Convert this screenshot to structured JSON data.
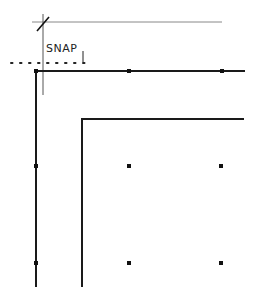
{
  "diagram": {
    "snap_label": "SNAP",
    "colors": {
      "line": "#1a1a1a",
      "guide": "#888888",
      "background": "#ffffff"
    },
    "outer_corner": {
      "x": 36,
      "y": 71,
      "right_end": 245,
      "bottom_end": 287
    },
    "inner_corner": {
      "x": 82,
      "y": 119,
      "right_end": 244,
      "bottom_end": 287
    },
    "outer_nodes": [
      {
        "x": 36,
        "y": 71
      },
      {
        "x": 129,
        "y": 71
      },
      {
        "x": 222,
        "y": 71
      },
      {
        "x": 36,
        "y": 166
      },
      {
        "x": 36,
        "y": 263
      }
    ],
    "grid_points": [
      {
        "x": 129,
        "y": 166
      },
      {
        "x": 221,
        "y": 166
      },
      {
        "x": 129,
        "y": 263
      },
      {
        "x": 221,
        "y": 263
      }
    ],
    "guide_line": {
      "x1": 32,
      "y1": 22,
      "x2": 222,
      "y2": 22
    },
    "crosshair_line": {
      "x": 43,
      "y1": 15,
      "y2": 95
    },
    "snap_tick": {
      "x": 40,
      "y1": 14,
      "y2": 30
    },
    "snap_dotted_line": {
      "x1": 10,
      "x2": 84,
      "y": 62
    },
    "snap_arrow": {
      "x": 83,
      "y1": 50,
      "y2": 62
    }
  }
}
